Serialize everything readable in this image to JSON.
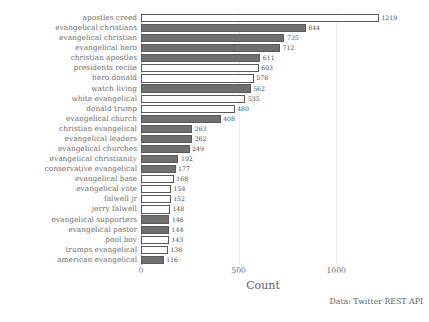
{
  "chart_data": {
    "type": "bar",
    "orientation": "horizontal",
    "title": "",
    "xlabel": "Count",
    "ylabel": "",
    "xlim": [
      0,
      1250
    ],
    "xticks": [
      0,
      500,
      1000
    ],
    "xtick_labels": [
      "0",
      "500",
      "1000"
    ],
    "grid": true,
    "grid_axis": "x",
    "legend": "none",
    "annotation": "Data: Twitter REST API",
    "bar_labels_shown": true,
    "colors": {
      "bar_dark": "#6f6f6f",
      "bar_light": "#fdfdfd",
      "bar_edge": "#5a5a5a",
      "grid": "#e9eef2",
      "text": "#6d6d6d",
      "background": "#ffffff"
    },
    "categories": [
      "apostles creed",
      "evangelical christians",
      "evangelical christian",
      "evangelical hero",
      "christian apostles",
      "presidents recite",
      "hero donald",
      "watch living",
      "white evangelical",
      "donald trump",
      "evangelical church",
      "christian evangelical",
      "evangelical leaders",
      "evangelical churches",
      "evangelical christianity",
      "conservative evangelical",
      "evangelical base",
      "evangelical vote",
      "falwell jr",
      "jerry falwell",
      "evangelical supporters",
      "evangelical pastor",
      "pool boy",
      "trumps evangelical",
      "american evangelical"
    ],
    "values": [
      1219,
      844,
      735,
      712,
      611,
      603,
      578,
      562,
      535,
      480,
      408,
      263,
      262,
      249,
      192,
      177,
      168,
      154,
      152,
      148,
      146,
      144,
      143,
      138,
      116
    ],
    "shades": [
      "light",
      "dark",
      "dark",
      "dark",
      "dark",
      "light",
      "light",
      "dark",
      "light",
      "light",
      "dark",
      "dark",
      "dark",
      "dark",
      "dark",
      "dark",
      "light",
      "light",
      "light",
      "light",
      "dark",
      "dark",
      "light",
      "light",
      "dark"
    ]
  }
}
